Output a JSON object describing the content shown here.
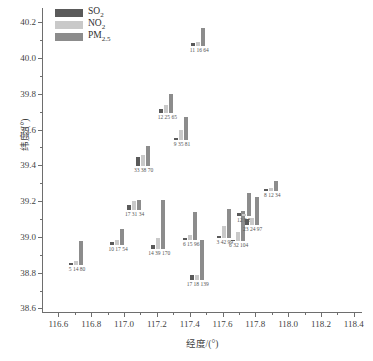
{
  "chart_data": {
    "type": "bar",
    "title": "",
    "xlabel": "经度/(°)",
    "ylabel": "纬度/(°)",
    "xlim": [
      116.5,
      118.45
    ],
    "ylim": [
      38.58,
      40.28
    ],
    "xticks": [
      "116.6",
      "116.8",
      "117.0",
      "117.2",
      "117.4",
      "117.6",
      "117.8",
      "118.0",
      "118.2",
      "118.4"
    ],
    "xtick_values": [
      116.6,
      116.8,
      117.0,
      117.2,
      117.4,
      117.6,
      117.8,
      118.0,
      118.2,
      118.4
    ],
    "yticks": [
      "38.6",
      "38.8",
      "39.0",
      "39.2",
      "39.4",
      "39.6",
      "39.8",
      "40.0",
      "40.2"
    ],
    "ytick_values": [
      38.6,
      38.8,
      39.0,
      39.2,
      39.4,
      39.6,
      39.8,
      40.0,
      40.2
    ],
    "grid": false,
    "legend_position": "top-left",
    "series": [
      {
        "name": "SO2",
        "display": "SO",
        "sub": "2",
        "color": "#5a5a5a"
      },
      {
        "name": "NO2",
        "display": "NO",
        "sub": "2",
        "color": "#c9c9c9"
      },
      {
        "name": "PM2.5",
        "display": "PM",
        "sub": "2.5",
        "color": "#8c8c8c"
      }
    ],
    "value_scale_max": 145,
    "points": [
      {
        "id": "p1",
        "lon": 116.665,
        "lat": 38.845,
        "label": "5 14 80",
        "values": [
          5,
          14,
          80
        ]
      },
      {
        "id": "p2",
        "lon": 116.915,
        "lat": 38.955,
        "label": "10 17 54",
        "values": [
          10,
          17,
          54
        ]
      },
      {
        "id": "p3",
        "lon": 117.015,
        "lat": 39.15,
        "label": "17 31 34",
        "values": [
          17,
          31,
          34
        ]
      },
      {
        "id": "p4",
        "lon": 117.07,
        "lat": 39.395,
        "label": "33 38 70",
        "values": [
          33,
          38,
          70
        ]
      },
      {
        "id": "p5",
        "lon": 117.165,
        "lat": 38.93,
        "label": "14 39 170",
        "values": [
          14,
          39,
          170
        ]
      },
      {
        "id": "p6",
        "lon": 117.215,
        "lat": 39.695,
        "label": "12 25 65",
        "values": [
          12,
          25,
          65
        ]
      },
      {
        "id": "p7",
        "lon": 117.305,
        "lat": 39.54,
        "label": "9 35 81",
        "values": [
          9,
          35,
          81
        ]
      },
      {
        "id": "p8",
        "lon": 117.36,
        "lat": 38.985,
        "label": "6 15 96",
        "values": [
          6,
          15,
          96
        ]
      },
      {
        "id": "p9",
        "lon": 117.41,
        "lat": 40.065,
        "label": "11 16 64",
        "values": [
          11,
          16,
          64
        ]
      },
      {
        "id": "p10",
        "lon": 117.4,
        "lat": 38.76,
        "label": "17 18 139",
        "values": [
          17,
          18,
          139
        ]
      },
      {
        "id": "p11",
        "lon": 117.565,
        "lat": 38.995,
        "label": "3 42 99",
        "values": [
          3,
          42,
          99
        ]
      },
      {
        "id": "p12",
        "lon": 117.65,
        "lat": 38.975,
        "label": "6 32 104",
        "values": [
          6,
          32,
          104
        ]
      },
      {
        "id": "p13",
        "lon": 117.69,
        "lat": 39.115,
        "label": "12 9 80",
        "values": [
          12,
          9,
          80
        ]
      },
      {
        "id": "p14",
        "lon": 117.735,
        "lat": 39.065,
        "label": "23 24 97",
        "values": [
          23,
          24,
          97
        ]
      },
      {
        "id": "p15",
        "lon": 117.855,
        "lat": 39.255,
        "label": "8 12 34",
        "values": [
          8,
          12,
          34
        ]
      }
    ]
  }
}
